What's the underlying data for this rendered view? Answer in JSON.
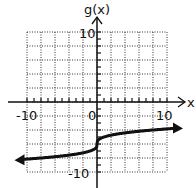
{
  "chart_data": {
    "type": "line",
    "title": "",
    "xlabel": "x",
    "ylabel": "g(x)",
    "xlim": [
      -10,
      10
    ],
    "ylim": [
      -10,
      10
    ],
    "grid": true,
    "grid_step": 2,
    "tick_labels": {
      "x": [
        "-10",
        "0",
        "10"
      ],
      "y": [
        "10",
        "-10"
      ]
    },
    "series": [
      {
        "name": "g(x)",
        "function": "cbrt(x) - 6",
        "arrows": "both ends",
        "x": [
          -11,
          -10,
          -8,
          -6,
          -4,
          -2,
          -1,
          -0.5,
          0,
          0.5,
          1,
          2,
          4,
          6,
          8,
          10,
          11.5
        ],
        "y": [
          -8.22,
          -8.15,
          -8.0,
          -7.82,
          -7.59,
          -7.26,
          -7.0,
          -6.79,
          -6.0,
          -5.21,
          -5.0,
          -4.74,
          -4.41,
          -4.18,
          -4.0,
          -3.85,
          -3.74
        ]
      }
    ]
  },
  "labels": {
    "y_axis": "g(x)",
    "x_axis": "x",
    "x_min": "-10",
    "x_max": "10",
    "origin": "0",
    "y_max": "10",
    "y_min": "-10"
  }
}
